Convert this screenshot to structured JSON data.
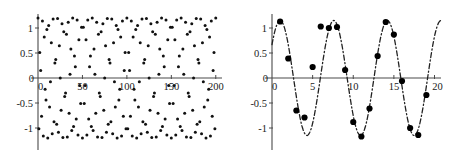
{
  "figure": {
    "title": "",
    "panels": [
      "left-aliased-scatter",
      "right-sampled-sine"
    ]
  },
  "chart_data": [
    {
      "type": "scatter",
      "title": "",
      "xlabel": "",
      "ylabel": "",
      "xlim": [
        0,
        207
      ],
      "ylim": [
        -1.25,
        1.25
      ],
      "xticks": [
        0,
        50,
        100,
        150,
        200
      ],
      "xtick_labels": [
        "0",
        "50",
        "100",
        "150",
        "200"
      ],
      "yticks": [
        -1,
        -0.5,
        0,
        0.5,
        1
      ],
      "ytick_labels": [
        "-1",
        "-0.5",
        "0",
        "0.5",
        "1"
      ],
      "grid": false,
      "legend": null,
      "marker": "dot",
      "series": [
        {
          "name": "aliased-samples",
          "x": [
            0,
            1,
            2,
            3,
            4,
            5,
            6,
            7,
            8,
            9,
            10,
            11,
            12,
            13,
            14,
            15,
            16,
            17,
            18,
            19,
            20,
            21,
            22,
            23,
            24,
            25,
            26,
            27,
            28,
            29,
            30,
            31,
            32,
            33,
            34,
            35,
            36,
            37,
            38,
            39,
            40,
            41,
            42,
            43,
            44,
            45,
            46,
            47,
            48,
            49,
            50,
            51,
            52,
            53,
            54,
            55,
            56,
            57,
            58,
            59,
            60,
            61,
            62,
            63,
            64,
            65,
            66,
            67,
            68,
            69,
            70,
            71,
            72,
            73,
            74,
            75,
            76,
            77,
            78,
            79,
            80,
            81,
            82,
            83,
            84,
            85,
            86,
            87,
            88,
            89,
            90,
            91,
            92,
            93,
            94,
            95,
            96,
            97,
            98,
            99,
            100,
            101,
            102,
            103,
            104,
            105,
            106,
            107,
            108,
            109,
            110,
            111,
            112,
            113,
            114,
            115,
            116,
            117,
            118,
            119,
            120,
            121,
            122,
            123,
            124,
            125,
            126,
            127,
            128,
            129,
            130,
            131,
            132,
            133,
            134,
            135,
            136,
            137,
            138,
            139,
            140,
            141,
            142,
            143,
            144,
            145,
            146,
            147,
            148,
            149,
            150,
            151,
            152,
            153,
            154,
            155,
            156,
            157,
            158,
            159,
            160,
            161,
            162,
            163,
            164,
            165,
            166,
            167,
            168,
            169,
            170,
            171,
            172,
            173,
            174,
            175,
            176,
            177,
            178,
            179,
            180,
            181,
            182,
            183,
            184,
            185,
            186,
            187,
            188,
            189,
            190,
            191,
            192,
            193,
            194,
            195,
            196,
            197,
            198,
            199,
            200
          ],
          "formula": "y = 1.2 * cos(2*pi*x*0.41)",
          "description": "Undersampled cosine producing aliased beat-like scatter envelope",
          "amplitude": 1.2,
          "frequency": 0.41
        }
      ]
    },
    {
      "type": "line",
      "title": "",
      "xlabel": "",
      "ylabel": "",
      "xlim": [
        0,
        20.8
      ],
      "ylim": [
        -1.25,
        1.25
      ],
      "xticks": [
        0,
        5,
        10,
        15,
        20
      ],
      "xtick_labels": [
        "0",
        "5",
        "10",
        "15",
        "20"
      ],
      "yticks": [
        -1,
        -0.5,
        0,
        0.5,
        1
      ],
      "ytick_labels": [
        "-1",
        "-0.5",
        "0",
        "0.5",
        "1"
      ],
      "grid": false,
      "legend": null,
      "linestyle": "dash-dot",
      "marker": "filled-circle",
      "series": [
        {
          "name": "reconstructed-sine",
          "formula": "y = 1.15 * cos(2*pi*(x-1)/6.6)",
          "amplitude": 1.15,
          "period": 6.6,
          "phase": 1.0,
          "sample_x": [
            1,
            2,
            3,
            4,
            5,
            6,
            7,
            8,
            9,
            10,
            11,
            12,
            13,
            14,
            15,
            16,
            17,
            18,
            19
          ],
          "sample_y": [
            1.13,
            0.39,
            -0.65,
            -0.79,
            0.22,
            1.03,
            1.0,
            1.02,
            0.16,
            -0.88,
            -1.17,
            -0.61,
            0.44,
            1.12,
            0.87,
            -0.06,
            -1.0,
            -1.14,
            -0.34
          ]
        }
      ]
    }
  ]
}
